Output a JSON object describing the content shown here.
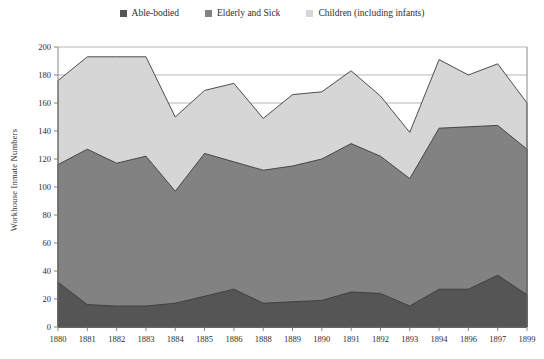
{
  "chart_data": {
    "type": "area",
    "stacked": true,
    "title": "",
    "subtitle": "",
    "xlabel": "",
    "ylabel": "Workhouse Inmate Numbers",
    "ylim": [
      0,
      200
    ],
    "ytick_step": 20,
    "yticks": [
      0,
      20,
      40,
      60,
      80,
      100,
      120,
      140,
      160,
      180,
      200
    ],
    "grid": "horizontal-partial",
    "legend_position": "top-center",
    "categories": [
      "1880",
      "1881",
      "1882",
      "1883",
      "1884",
      "1885",
      "1886",
      "1888",
      "1889",
      "1890",
      "1891",
      "1892",
      "1893",
      "1894",
      "1896",
      "1897",
      "1899"
    ],
    "series": [
      {
        "name": "Able-bodied",
        "color": "#555555",
        "values": [
          32,
          16,
          15,
          15,
          17,
          22,
          27,
          17,
          18,
          19,
          25,
          24,
          15,
          27,
          27,
          37,
          23
        ]
      },
      {
        "name": "Elderly and Sick",
        "color": "#828282",
        "values": [
          84,
          111,
          102,
          107,
          80,
          102,
          91,
          95,
          97,
          101,
          106,
          98,
          91,
          115,
          116,
          107,
          104
        ]
      },
      {
        "name": "Children (including infants)",
        "color": "#d6d6d6",
        "values": [
          60,
          66,
          76,
          71,
          53,
          45,
          56,
          37,
          51,
          48,
          52,
          43,
          33,
          49,
          37,
          44,
          33
        ]
      }
    ],
    "cumulative_totals": [
      176,
      193,
      193,
      193,
      150,
      169,
      174,
      149,
      166,
      168,
      183,
      165,
      139,
      191,
      180,
      188,
      160
    ],
    "boundary_able_plus_elderly": [
      116,
      127,
      117,
      122,
      97,
      124,
      118,
      112,
      115,
      120,
      131,
      122,
      106,
      142,
      143,
      144,
      127
    ]
  },
  "legend": {
    "items": [
      {
        "label": "Able-bodied",
        "color": "#555555"
      },
      {
        "label": "Elderly and Sick",
        "color": "#828282"
      },
      {
        "label": "Children (including infants)",
        "color": "#d6d6d6"
      }
    ]
  },
  "axes": {
    "y_title": "Workhouse Inmate Numbers"
  }
}
